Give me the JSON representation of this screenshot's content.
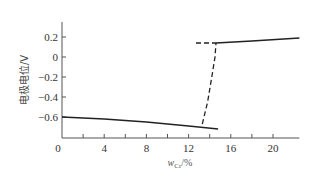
{
  "chart_data": {
    "type": "line",
    "title": "",
    "xlabel": "w_Cr/%",
    "xlabel_main": "w",
    "xlabel_sub": "Cr",
    "xlabel_unit": "/%",
    "ylabel": "电极电位/V",
    "xlim": [
      0,
      22.5
    ],
    "ylim": [
      -0.81,
      0.35
    ],
    "x_ticks": [
      0,
      4,
      8,
      12,
      16,
      20
    ],
    "x_minor_ticks": [
      2,
      6,
      10,
      14,
      18
    ],
    "y_ticks": [
      0.2,
      0,
      -0.2,
      -0.4,
      -0.6
    ],
    "y_tick_labels": [
      "0.2",
      "0",
      "−0.2",
      "−0.4",
      "−0.6"
    ],
    "x_tick_labels": [
      "0",
      "4",
      "8",
      "12",
      "16",
      "20"
    ],
    "grid": false,
    "legend": null,
    "series": [
      {
        "name": "active-region",
        "style": "solid",
        "x": [
          0,
          4,
          8,
          12,
          14.8
        ],
        "y": [
          -0.6,
          -0.62,
          -0.65,
          -0.69,
          -0.72
        ]
      },
      {
        "name": "passive-region",
        "style": "solid",
        "x": [
          14.6,
          18,
          22.5
        ],
        "y": [
          0.14,
          0.16,
          0.19
        ]
      },
      {
        "name": "passive-extension",
        "style": "dashed",
        "x": [
          12.7,
          14.6
        ],
        "y": [
          0.14,
          0.14
        ]
      },
      {
        "name": "transition",
        "style": "dashed",
        "x": [
          13.3,
          13.8,
          14.2,
          14.5,
          14.6
        ],
        "y": [
          -0.67,
          -0.45,
          -0.2,
          0.0,
          0.14
        ]
      }
    ]
  },
  "colors": {
    "line": "#222222",
    "axis": "#555555"
  }
}
